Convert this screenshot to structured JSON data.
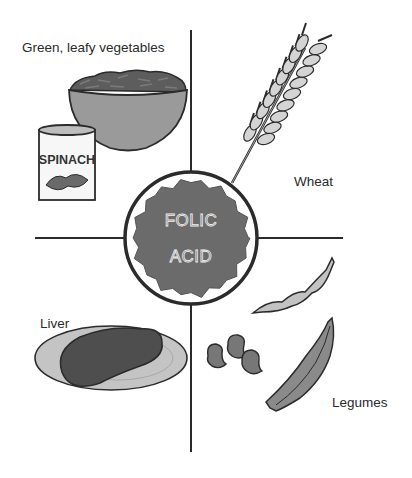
{
  "center": {
    "line1": "FOLIC",
    "line2": "ACID"
  },
  "quadrants": {
    "top_left": {
      "label": "Green, leafy vegetables",
      "can_label": "SPINACH"
    },
    "top_right": {
      "label": "Wheat"
    },
    "bottom_left": {
      "label": "Liver"
    },
    "bottom_right": {
      "label": "Legumes"
    }
  },
  "colors": {
    "line": "#2b2b2b",
    "dark_fill": "#5a5a5a",
    "mid_fill": "#8a8a8a",
    "light_fill": "#c8c8c8",
    "background": "#ffffff"
  }
}
